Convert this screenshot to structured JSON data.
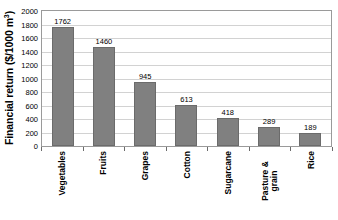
{
  "chart_data": {
    "type": "bar",
    "title": "",
    "xlabel": "",
    "ylabel": "Financial return ($/1000 m",
    "ylabel_superscript": "3",
    "ylabel_suffix": ")",
    "categories": [
      "Vegetables",
      "Fruits",
      "Grapes",
      "Cotton",
      "Sugarcane",
      "Pasture & grain",
      "Rice"
    ],
    "values": [
      1762,
      1460,
      945,
      613,
      418,
      289,
      189
    ],
    "value_labels": [
      "1762",
      "1460",
      "945",
      "613",
      "418",
      "289",
      "189"
    ],
    "ylim": [
      0,
      2000
    ],
    "ytick_step": 200,
    "yticks": [
      "2000",
      "1800",
      "1600",
      "1400",
      "1200",
      "1000",
      "800",
      "600",
      "400",
      "200",
      "0"
    ],
    "grid": true,
    "grid_axis": "y",
    "legend": false,
    "bar_color": "#808080",
    "bar_border_color": "#6b6b6b",
    "gridline_color": "#d2d2d2",
    "axis_color": "#9a9a9a",
    "text_color": "#000000",
    "background": "#ffffff"
  }
}
